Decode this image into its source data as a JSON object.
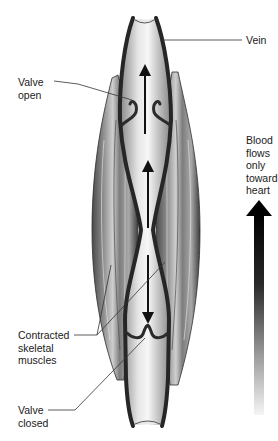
{
  "diagram": {
    "labels": {
      "vein": "Vein",
      "valve_open": "Valve\nopen",
      "flow_note": "Blood\nflows\nonly\ntoward\nheart",
      "muscles": "Contracted\nskeletal\nmuscles",
      "valve_closed": "Valve\nclosed"
    },
    "colors": {
      "background": "#ffffff",
      "vein_wall": "#2b2b2b",
      "vein_lumen_light": "#f2f2f2",
      "vein_lumen_dark": "#9a9a9a",
      "muscle_dark": "#3a3a3a",
      "muscle_light": "#bdbdbd",
      "leader_line": "#333333",
      "flow_arrow_top": "#000000",
      "flow_arrow_bottom": "#f5f5f5"
    },
    "icons": {
      "flow_arrow": "up-arrow-gradient",
      "blood_direction_upper": "up-arrow",
      "blood_direction_middle": "up-arrow",
      "blood_direction_lower": "down-arrow"
    }
  }
}
